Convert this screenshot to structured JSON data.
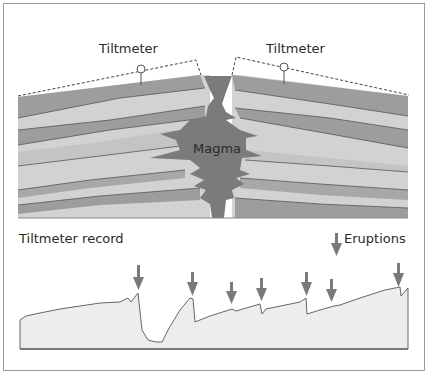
{
  "diagram": {
    "labels": {
      "tiltmeter_left": "Tiltmeter",
      "tiltmeter_right": "Tiltmeter",
      "magma": "Magma",
      "record_title": "Tiltmeter record",
      "legend": "Eruptions"
    },
    "colors": {
      "dark_layer": "#9d9d9d",
      "light_layer": "#d2d2d2",
      "magma": "#7b7b7b",
      "line": "#555555",
      "record_fill": "#ededed",
      "arrow": "#7a7a7a"
    },
    "record": {
      "eruption_count": 7
    }
  }
}
